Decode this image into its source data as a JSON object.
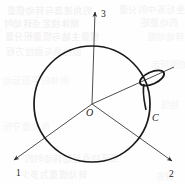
{
  "figure": {
    "background_color": "#fefefe",
    "stroke_color": "#1a1a1a",
    "axis_color": "#555555",
    "ghost_text_color": "#ece9ec",
    "labels": {
      "axis_1": "1",
      "axis_2": "2",
      "axis_3": "3",
      "origin": "O",
      "point_c": "C"
    },
    "geometry": {
      "circle": {
        "center_x": 92,
        "center_y": 104,
        "radius": 58,
        "stroke_width": 1.7
      },
      "axis_3": {
        "from_x": 92,
        "from_y": 104,
        "to_x": 95,
        "to_y": 12
      },
      "axis_1": {
        "from_x": 92,
        "from_y": 104,
        "to_x": 14,
        "to_y": 160
      },
      "axis_2": {
        "from_x": 92,
        "from_y": 104,
        "to_x": 172,
        "to_y": 161
      },
      "axis_c": {
        "from_x": 92,
        "from_y": 104,
        "to_x": 174,
        "to_y": 67
      },
      "loop": {
        "center_x": 152,
        "center_y": 78,
        "rx": 13,
        "ry": 6,
        "rotation_deg": -24
      }
    }
  },
  "ghost_text": {
    "lines": [
      {
        "text": "的角速度与转动惯量",
        "x": 6,
        "y": 4,
        "size": 9,
        "opacity": 0.7
      },
      {
        "text": "上述坐标系中的分量",
        "x": 118,
        "y": 3,
        "size": 9,
        "opacity": 0.6
      },
      {
        "text": "刚体绕定点转动时",
        "x": 3,
        "y": 17,
        "size": 9,
        "opacity": 0.75
      },
      {
        "text": "的动量矩",
        "x": 140,
        "y": 16,
        "size": 9,
        "opacity": 0.6
      },
      {
        "text": "惯量主轴与惯量积分量",
        "x": 4,
        "y": 30,
        "size": 9,
        "opacity": 0.7
      },
      {
        "text": "转动动能",
        "x": 146,
        "y": 30,
        "size": 9,
        "opacity": 0.55
      },
      {
        "text": "欧拉角与欧拉方程",
        "x": 5,
        "y": 45,
        "size": 9,
        "opacity": 0.6
      },
      {
        "text": "如图所示",
        "x": 150,
        "y": 58,
        "size": 9,
        "opacity": 0.5
      },
      {
        "text": "刚体的平面运动",
        "x": 2,
        "y": 74,
        "size": 9,
        "opacity": 0.45
      },
      {
        "text": "轴线",
        "x": 160,
        "y": 98,
        "size": 9,
        "opacity": 0.45
      },
      {
        "text": "角动量守恒",
        "x": 2,
        "y": 120,
        "size": 9,
        "opacity": 0.45
      },
      {
        "text": "细环绕直径轴转动时的",
        "x": 24,
        "y": 152,
        "size": 9,
        "opacity": 0.6
      },
      {
        "text": "转动惯量为多少",
        "x": 20,
        "y": 168,
        "size": 9,
        "opacity": 0.65
      },
      {
        "text": "解答",
        "x": 155,
        "y": 170,
        "size": 9,
        "opacity": 0.5
      }
    ]
  }
}
